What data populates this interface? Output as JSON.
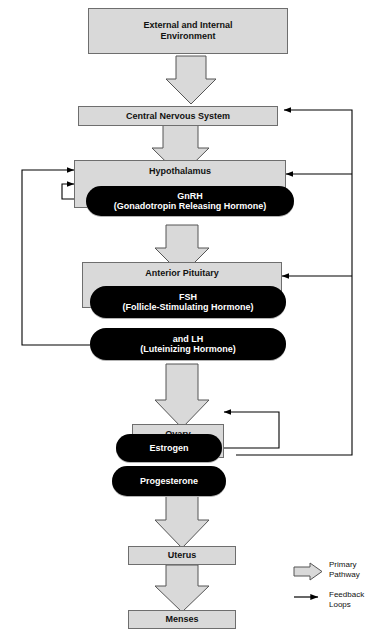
{
  "diagram": {
    "colors": {
      "box_fill": "#d9d9d9",
      "box_border": "#6e6e6e",
      "pill_fill": "#000000",
      "pill_text": "#ffffff",
      "arrow_fill": "#d9d9d9",
      "arrow_border": "#555555",
      "feedback_line": "#000000"
    },
    "boxes": [
      {
        "id": "external",
        "label": "External and Internal\nEnvironment",
        "line1": "External and Internal",
        "line2": "Environment"
      },
      {
        "id": "cns",
        "label": "Central Nervous System"
      },
      {
        "id": "hypothalamus",
        "label": "Hypothalamus"
      },
      {
        "id": "pituitary",
        "label": "Anterior Pituitary"
      },
      {
        "id": "ovary",
        "label": "Ovary"
      },
      {
        "id": "uterus",
        "label": "Uterus"
      },
      {
        "id": "menses",
        "label": "Menses"
      }
    ],
    "pills": [
      {
        "id": "gnrh",
        "line1": "GnRH",
        "line2": "(Gonadotropin Releasing Hormone)"
      },
      {
        "id": "fsh",
        "line1": "FSH",
        "line2": "(Follicle-Stimulating Hormone)"
      },
      {
        "id": "lh",
        "line1": "and LH",
        "line2": "(Luteinizing Hormone)"
      },
      {
        "id": "estrogen",
        "line1": "Estrogen",
        "line2": ""
      },
      {
        "id": "progesterone",
        "line1": "Progesterone",
        "line2": ""
      }
    ],
    "legend": {
      "primary": {
        "line1": "Primary",
        "line2": "Pathway"
      },
      "feedback": {
        "line1": "Feedback",
        "line2": "Loops"
      }
    }
  }
}
